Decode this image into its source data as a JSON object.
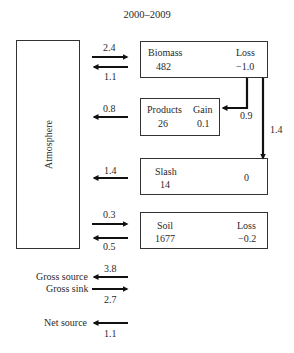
{
  "title": "2000–2009",
  "atmosphere": {
    "label": "Atmosphere"
  },
  "pools": {
    "biomass": {
      "name": "Biomass",
      "stock": "482",
      "change_label": "Loss",
      "change": "−1.0"
    },
    "products": {
      "name": "Products",
      "stock": "26",
      "change_label": "Gain",
      "change": "0.1"
    },
    "slash": {
      "name": "Slash",
      "stock": "14",
      "change": "0"
    },
    "soil": {
      "name": "Soil",
      "stock": "1677",
      "change_label": "Loss",
      "change": "−0.2"
    }
  },
  "fluxes": {
    "biomass_uptake": "2.4",
    "biomass_release": "1.1",
    "products_release": "0.8",
    "slash_release": "1.4",
    "soil_uptake": "0.3",
    "soil_release": "0.5",
    "biomass_to_products": "0.9",
    "biomass_to_slash": "1.4"
  },
  "summary": {
    "gross_source": {
      "label": "Gross source",
      "value": "3.8"
    },
    "gross_sink": {
      "label": "Gross sink",
      "value": "2.7"
    },
    "net_source": {
      "label": "Net source",
      "value": "1.1"
    }
  },
  "colors": {
    "line": "#111111",
    "border": "#333333",
    "text": "#2a2a2a"
  }
}
